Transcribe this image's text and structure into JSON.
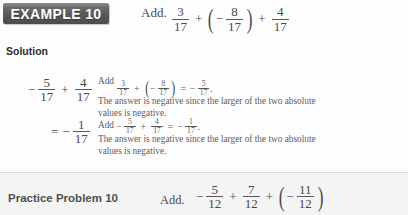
{
  "example": {
    "badge_label": "EXAMPLE 10",
    "prompt": "Add.",
    "expression": {
      "term1": {
        "num": "3",
        "den": "17"
      },
      "op1": "+",
      "term2": {
        "sign": "−",
        "num": "8",
        "den": "17"
      },
      "op2": "+",
      "term3": {
        "num": "4",
        "den": "17"
      },
      "paren_open": "(",
      "paren_close": ")"
    }
  },
  "solution": {
    "label": "Solution",
    "step1": {
      "sign": "−",
      "frac1": {
        "num": "5",
        "den": "17"
      },
      "op": "+",
      "frac2": {
        "num": "4",
        "den": "17"
      },
      "note_math_prefix": "Add",
      "note_math": {
        "a": {
          "num": "3",
          "den": "17"
        },
        "op1": "+",
        "b": {
          "sign": "−",
          "num": "8",
          "den": "17"
        },
        "eq": "=",
        "result": {
          "sign": "−",
          "num": "5",
          "den": "17"
        },
        "period": ".",
        "paren_open": "(",
        "paren_close": ")"
      },
      "note_text_line1": "The answer is negative since the larger of the two absolute",
      "note_text_line2": "values is negative."
    },
    "step2": {
      "equals": "=",
      "sign": "−",
      "frac": {
        "num": "1",
        "den": "17"
      },
      "note_math_prefix": "Add",
      "note_math": {
        "a": {
          "sign": "−",
          "num": "5",
          "den": "17"
        },
        "op1": "+",
        "b": {
          "num": "4",
          "den": "17"
        },
        "eq": "=",
        "result": {
          "sign": "−",
          "num": "1",
          "den": "17"
        },
        "period": "."
      },
      "note_text_line1": "The answer is negative since the larger of the two absolute",
      "note_text_line2": "values is negative."
    }
  },
  "practice": {
    "label": "Practice Problem 10",
    "prompt": "Add.",
    "expression": {
      "term1": {
        "sign": "−",
        "num": "5",
        "den": "12"
      },
      "op1": "+",
      "term2": {
        "num": "7",
        "den": "12"
      },
      "op2": "+",
      "term3": {
        "sign": "−",
        "num": "11",
        "den": "12"
      },
      "paren_open": "(",
      "paren_close": ")"
    }
  },
  "colors": {
    "badge_bg": "#565656",
    "badge_text": "#ffffff",
    "body_text": "#4a4a4a",
    "band_bg": "#f4f4f4",
    "divider": "#d8d8d8"
  }
}
